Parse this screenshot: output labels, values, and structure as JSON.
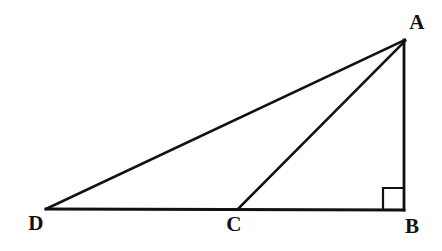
{
  "figure": {
    "kind": "geometry-diagram",
    "canvas": {
      "width": 442,
      "height": 251
    },
    "background_color": "#ffffff",
    "stroke_color": "#111111",
    "label_color": "#111111"
  },
  "points": [
    {
      "id": "A",
      "label": "A",
      "x": 405,
      "y": 40,
      "label_x": 417,
      "label_y": 22
    },
    {
      "id": "B",
      "label": "B",
      "x": 404,
      "y": 210,
      "label_x": 412,
      "label_y": 226
    },
    {
      "id": "C",
      "label": "C",
      "x": 238,
      "y": 209,
      "label_x": 234,
      "label_y": 224
    },
    {
      "id": "D",
      "label": "D",
      "x": 46,
      "y": 209,
      "label_x": 36,
      "label_y": 223
    }
  ],
  "segments": [
    {
      "id": "DA",
      "from": "D",
      "to": "A",
      "x1": 46,
      "y1": 209,
      "x2": 405,
      "y2": 40,
      "width": 2.6
    },
    {
      "id": "DB",
      "from": "D",
      "to": "B",
      "x1": 46,
      "y1": 209,
      "x2": 404,
      "y2": 210,
      "width": 2.8
    },
    {
      "id": "CA",
      "from": "C",
      "to": "A",
      "x1": 238,
      "y1": 209,
      "x2": 405,
      "y2": 41,
      "width": 2.6
    },
    {
      "id": "AB",
      "from": "A",
      "to": "B",
      "x1": 404,
      "y1": 40,
      "x2": 404,
      "y2": 210,
      "width": 2.8
    }
  ],
  "right_angle": {
    "at_point": "B",
    "size": 21,
    "x": 383,
    "y": 188,
    "path": "M 383 209 L 383 188 L 404 188"
  },
  "chart_data": {
    "type": "diagram",
    "vertices": {
      "A": [
        405,
        40
      ],
      "B": [
        404,
        210
      ],
      "C": [
        238,
        209
      ],
      "D": [
        46,
        209
      ]
    },
    "edges": [
      "D-A",
      "D-B",
      "C-A",
      "A-B"
    ],
    "annotations": [
      {
        "type": "right-angle",
        "vertex": "B",
        "between": [
          "A-B",
          "D-B"
        ]
      }
    ],
    "labels": [
      "A",
      "B",
      "C",
      "D"
    ]
  }
}
